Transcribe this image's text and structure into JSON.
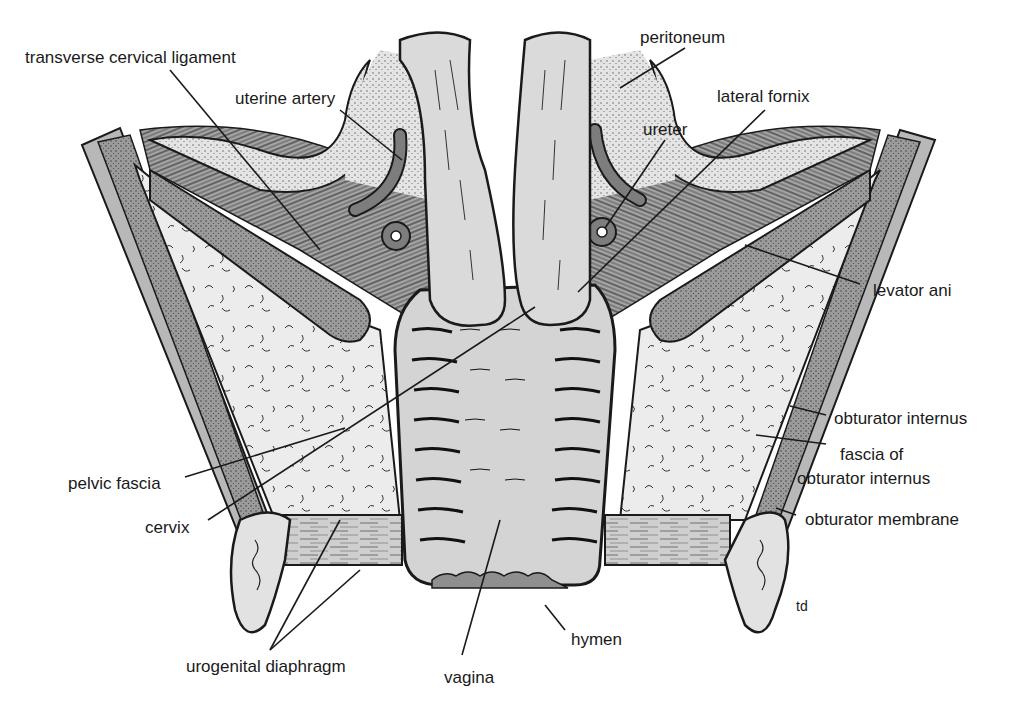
{
  "figure": {
    "type": "anatomical-diagram",
    "signature": "td",
    "colors": {
      "background": "#ffffff",
      "outline": "#1a1a1a",
      "dark_tissue": "#8c8c8c",
      "muscle": "#9a9a9a",
      "light_tissue": "#d6d6d6",
      "fat": "#ececec",
      "pale": "#e2e2e2"
    }
  },
  "labels": {
    "transverse_cervical_ligament": "transverse cervical ligament",
    "uterine_artery": "uterine artery",
    "peritoneum": "peritoneum",
    "lateral_fornix": "lateral fornix",
    "ureter": "ureter",
    "levator_ani": "levator ani",
    "obturator_internus": "obturator internus",
    "fascia_of_obturator_internus_1": "fascia of",
    "fascia_of_obturator_internus_2": "obturator internus",
    "obturator_membrane": "obturator membrane",
    "pelvic_fascia": "pelvic fascia",
    "cervix": "cervix",
    "urogenital_diaphragm": "urogenital diaphragm",
    "vagina": "vagina",
    "hymen": "hymen"
  }
}
